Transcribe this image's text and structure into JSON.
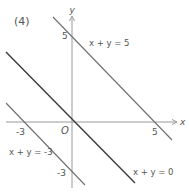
{
  "problem_label": "(4)",
  "axes": {
    "x_label": "x",
    "y_label": "y",
    "origin_label": "O"
  },
  "ticks": {
    "x_pos": "5",
    "x_neg": "-3",
    "y_pos": "5",
    "y_neg": "-3"
  },
  "lines": [
    {
      "equation": "x + y = 5",
      "intercept": 5,
      "emphasis": "normal"
    },
    {
      "equation": "x + y = 0",
      "intercept": 0,
      "emphasis": "bold"
    },
    {
      "equation": "x + y = -3",
      "intercept": -3,
      "emphasis": "normal"
    }
  ],
  "colors": {
    "line": "#6e6e6e",
    "line_bold": "#3a3a3a",
    "axis": "#9a9a9a",
    "text": "#555555"
  }
}
